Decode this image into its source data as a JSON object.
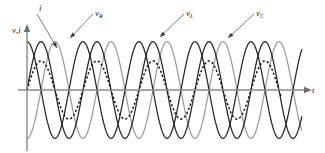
{
  "figure": {
    "title": "",
    "background": "#ffffff"
  },
  "axes": {
    "y_label": "v, i",
    "y_label_v": "v",
    "y_label_comma": ",",
    "y_label_i": "i",
    "x_label": "t",
    "origin_x": 27,
    "origin_y": 90,
    "x_axis_end": 306,
    "y_axis_top": 26,
    "y_axis_bottom": 151
  },
  "annotations": [
    {
      "name": "i",
      "label": "i",
      "sub": "",
      "text_x": 39,
      "text_y": 11,
      "leader_x1": 37,
      "leader_y1": 14,
      "leader_x2": 57,
      "leader_y2": 48
    },
    {
      "name": "vR",
      "label": "v",
      "sub": "R",
      "text_x": 95,
      "text_y": 16,
      "leader_x1": 93,
      "leader_y1": 14,
      "leader_x2": 70,
      "leader_y2": 38
    },
    {
      "name": "vL",
      "label": "v",
      "sub": "L",
      "text_x": 186,
      "text_y": 16,
      "leader_x1": 184,
      "leader_y1": 14,
      "leader_x2": 160,
      "leader_y2": 37
    },
    {
      "name": "vC",
      "label": "v",
      "sub": "C",
      "text_x": 256,
      "text_y": 16,
      "leader_x1": 254,
      "leader_y1": 14,
      "leader_x2": 228,
      "leader_y2": 38
    }
  ],
  "colors": {
    "dark_curve": "#262626",
    "gray_curve": "#9a9a9a",
    "dotted_curve": "#141414",
    "axis": "#8a8a8a",
    "text": "#1a1a1a"
  },
  "chart_data": {
    "type": "line",
    "title": "",
    "xlabel": "t",
    "ylabel": "v, i",
    "grid": false,
    "legend": "inline-annotations",
    "x_range_px": [
      27,
      306
    ],
    "baseline_px": 90,
    "period_px": 56,
    "xlim": [
      0,
      5.0
    ],
    "ylim": [
      -1.15,
      1.15
    ],
    "x_units": "periods",
    "series": [
      {
        "name": "v_R",
        "style": "solid",
        "color": "#262626",
        "amplitude": 0.93,
        "phase_deg": 0,
        "description": "Resistor voltage, in phase with current, peaks at 52 px amplitude",
        "peaks_t": [
          0.25,
          1.25,
          2.25,
          3.25,
          4.25
        ],
        "troughs_t": [
          0.75,
          1.75,
          2.75,
          3.75,
          4.75
        ],
        "zeros_t": [
          0,
          0.5,
          1.0,
          1.5,
          2.0,
          2.5,
          3.0,
          3.5,
          4.0,
          4.5,
          5.0
        ]
      },
      {
        "name": "v_L",
        "style": "solid",
        "color": "#262626",
        "amplitude": 0.93,
        "phase_deg": 90,
        "description": "Inductor voltage, leads current by 90 degrees",
        "peaks_t": [
          0.0,
          1.0,
          2.0,
          3.0,
          4.0,
          5.0
        ],
        "troughs_t": [
          0.5,
          1.5,
          2.5,
          3.5,
          4.5
        ],
        "zeros_t": [
          0.25,
          0.75,
          1.25,
          1.75,
          2.25,
          2.75,
          3.25,
          3.75,
          4.25,
          4.75
        ]
      },
      {
        "name": "v_C",
        "style": "solid",
        "color": "#9a9a9a",
        "amplitude": 0.93,
        "phase_deg": -90,
        "description": "Capacitor voltage, lags current by 90 degrees",
        "peaks_t": [
          0.5,
          1.5,
          2.5,
          3.5,
          4.5
        ],
        "troughs_t": [
          0.0,
          1.0,
          2.0,
          3.0,
          4.0,
          5.0
        ],
        "zeros_t": [
          0.25,
          0.75,
          1.25,
          1.75,
          2.25,
          2.75,
          3.25,
          3.75,
          4.25,
          4.75
        ]
      },
      {
        "name": "i",
        "style": "dashed",
        "color": "#141414",
        "amplitude": 0.56,
        "phase_deg": 0,
        "description": "Current waveform, smaller amplitude, in phase with v_R",
        "peaks_t": [
          0.25,
          1.25,
          2.25,
          3.25,
          4.25
        ],
        "troughs_t": [
          0.75,
          1.75,
          2.75,
          3.75,
          4.75
        ],
        "zeros_t": [
          0,
          0.5,
          1.0,
          1.5,
          2.0,
          2.5,
          3.0,
          3.5,
          4.0,
          4.5,
          5.0
        ]
      }
    ]
  }
}
